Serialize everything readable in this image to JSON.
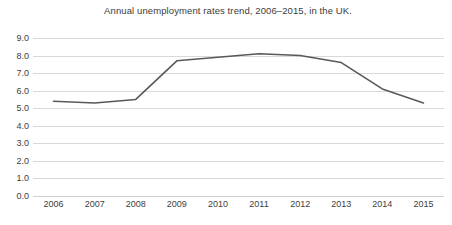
{
  "chart_data": {
    "type": "line",
    "title": "Annual unemployment rates trend, 2006–2015, in the UK.",
    "xlabel": "",
    "ylabel": "",
    "categories": [
      "2006",
      "2007",
      "2008",
      "2009",
      "2010",
      "2011",
      "2012",
      "2013",
      "2014",
      "2015"
    ],
    "values": [
      5.4,
      5.3,
      5.5,
      7.7,
      7.9,
      8.1,
      8.0,
      7.6,
      6.1,
      5.3
    ],
    "series": [
      {
        "name": "Annual unemployment rate",
        "values": [
          5.4,
          5.3,
          5.5,
          7.7,
          7.9,
          8.1,
          8.0,
          7.6,
          6.1,
          5.3
        ]
      }
    ],
    "ylim": [
      0.0,
      9.0
    ],
    "ytick_step": 1.0,
    "ytick_labels": [
      "9.0",
      "8.0",
      "7.0",
      "6.0",
      "5.0",
      "4.0",
      "3.0",
      "2.0",
      "1.0",
      "0.0"
    ],
    "ytick_values": [
      9.0,
      8.0,
      7.0,
      6.0,
      5.0,
      4.0,
      3.0,
      2.0,
      1.0,
      0.0
    ],
    "grid": true,
    "grid_axis": "y",
    "legend": false,
    "legend_position": "none",
    "line_color": "#595959",
    "grid_color": "#d9d9d9",
    "background_color": "#ffffff",
    "text_color": "#404040"
  }
}
